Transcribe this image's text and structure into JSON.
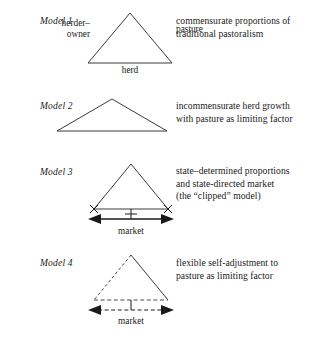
{
  "figure": {
    "title_present": false,
    "background_color": "#ffffff",
    "ink_color": "#1a1a1a",
    "rows": [
      {
        "model_label": "Model 1",
        "description": "commensurate proportions of\ntraditional pastoralism",
        "shape": "equilateral-triangle",
        "vertex_labels": {
          "left": "herder–\nowner",
          "right": "pasture",
          "base": "herd"
        },
        "market_label": null,
        "has_market_arrow": false,
        "has_clip_marks": false,
        "dashed": false
      },
      {
        "model_label": "Model 2",
        "description": "incommensurate herd growth\nwith pasture as limiting factor",
        "shape": "wide-flat-triangle",
        "vertex_labels": {},
        "market_label": null,
        "has_market_arrow": false,
        "has_clip_marks": false,
        "dashed": false
      },
      {
        "model_label": "Model 3",
        "description": "state–determined proportions\nand state-directed market\n(the “clipped” model)",
        "shape": "equilateral-triangle",
        "vertex_labels": {},
        "market_label": "market",
        "has_market_arrow": true,
        "has_clip_marks": true,
        "dashed": false
      },
      {
        "model_label": "Model 4",
        "description": "flexible self-adjustment to\npasture as limiting factor",
        "shape": "equilateral-triangle",
        "vertex_labels": {},
        "market_label": "market",
        "has_market_arrow": true,
        "has_clip_marks": false,
        "dashed": true
      }
    ]
  }
}
